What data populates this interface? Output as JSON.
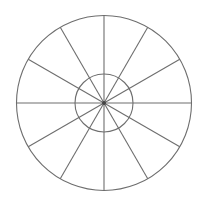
{
  "diagram": {
    "type": "polar-grid",
    "center": {
      "x": 104,
      "y": 103
    },
    "outer_radius": 87.5,
    "inner_radius": 29,
    "spoke_count": 12,
    "spoke_angle_step_deg": 30,
    "colors": {
      "background": "#ffffff",
      "stroke": "#6e6e6e",
      "center_dot": "#444444"
    },
    "stroke_width": 1.1
  }
}
